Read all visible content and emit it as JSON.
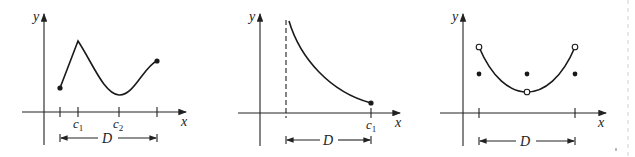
{
  "figure": {
    "panels": [
      {
        "id": "piecewise-cusp",
        "y_label": "y",
        "x_label": "x",
        "ticks": [
          "c",
          "c"
        ],
        "tick_subscripts": [
          "1",
          "2"
        ],
        "domain_label": "D",
        "description": "Continuous function on closed interval D with cusp (max) at c1 and smooth minimum at c2; endpoints closed dots"
      },
      {
        "id": "decreasing-asymptote",
        "y_label": "y",
        "x_label": "x",
        "ticks": [
          "c"
        ],
        "tick_subscripts": [
          "1"
        ],
        "domain_label": "D",
        "description": "Decreasing function on half-open interval D with vertical asymptote (dashed) at left end; closed endpoint at c1"
      },
      {
        "id": "discontinuous-parabola",
        "y_label": "y",
        "x_label": "x",
        "domain_label": "D",
        "description": "Parabola-like curve with open circles at both endpoints and at vertex; filled dots below at endpoints and midpoint"
      }
    ],
    "colors": {
      "ink": "#1a1a1a",
      "background": "#ffffff"
    }
  }
}
